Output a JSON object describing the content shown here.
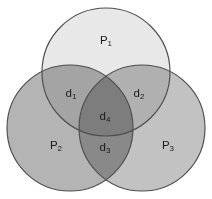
{
  "figure": {
    "name": "three-set-venn-diagram",
    "background_color": "#ffffff",
    "width": 212,
    "height": 199,
    "outline_color": "#4d4d4d",
    "label_color": "#1c1c1c"
  },
  "sets": [
    {
      "id": "p1",
      "label_base": "P",
      "label_sub": "1",
      "label_text": "P1",
      "fill_color": "#e8e8e8",
      "cx": 106,
      "cy": 72,
      "r": 64,
      "label_x": 106,
      "label_y": 41
    },
    {
      "id": "p2",
      "label_base": "P",
      "label_sub": "2",
      "label_text": "P2",
      "fill_color": "#b4b4b4",
      "cx": 70,
      "cy": 128,
      "r": 63,
      "label_x": 56,
      "label_y": 146
    },
    {
      "id": "p3",
      "label_base": "P",
      "label_sub": "3",
      "label_text": "P3",
      "fill_color": "#c2c2c2",
      "cx": 142,
      "cy": 128,
      "r": 63,
      "label_x": 168,
      "label_y": 146
    }
  ],
  "regions": [
    {
      "id": "d1",
      "label_base": "d",
      "label_sub": "1",
      "label_text": "d1",
      "description": "P1 intersect P2",
      "label_x": 71,
      "label_y": 94
    },
    {
      "id": "d2",
      "label_base": "d",
      "label_sub": "2",
      "label_text": "d2",
      "description": "P1 intersect P3",
      "label_x": 139,
      "label_y": 94
    },
    {
      "id": "d3",
      "label_base": "d",
      "label_sub": "3",
      "label_text": "d3",
      "description": "P2 intersect P3",
      "label_x": 105,
      "label_y": 148
    },
    {
      "id": "d4",
      "label_base": "d",
      "label_sub": "4",
      "label_text": "d4",
      "description": "P1 intersect P2 intersect P3",
      "label_x": 105,
      "label_y": 117
    }
  ],
  "watermark": {
    "text": "",
    "visible": false
  }
}
